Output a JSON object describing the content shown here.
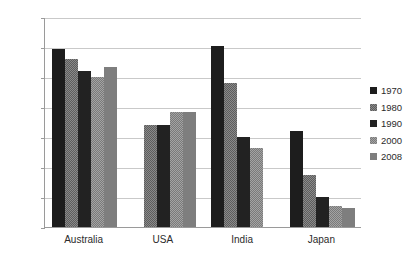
{
  "chart_data": {
    "type": "bar",
    "title": "",
    "subtitle": "",
    "xlabel": "",
    "ylabel": "",
    "categories": [
      "Australia",
      "USA",
      "India",
      "Japan"
    ],
    "ylim": [
      0.0,
      70.0
    ],
    "ytick_labels": [
      "70.0",
      "60.0",
      "50.0",
      "40.0",
      "30.0",
      "20.0",
      "10.0",
      "0.0"
    ],
    "ytick_values": [
      70.0,
      60.0,
      50.0,
      40.0,
      30.0,
      20.0,
      10.0,
      0.0
    ],
    "grid": true,
    "grid_axis": "y",
    "legend_position": "right",
    "series": [
      {
        "name": "1970",
        "color": "#1d1d1d",
        "values": [
          59.5,
          null,
          60.5,
          32.0
        ]
      },
      {
        "name": "1980",
        "color": "#8a8a8a",
        "values": [
          56.0,
          34.0,
          48.0,
          17.5
        ]
      },
      {
        "name": "1990",
        "color": "#222222",
        "values": [
          52.0,
          34.0,
          30.0,
          10.0
        ]
      },
      {
        "name": "2000",
        "color": "#a3a3a3",
        "values": [
          50.0,
          38.5,
          26.5,
          7.0
        ]
      },
      {
        "name": "2008",
        "color": "#7e7e7e",
        "values": [
          53.5,
          38.5,
          null,
          6.5
        ]
      }
    ]
  },
  "legend": {
    "items": [
      {
        "label": "1970"
      },
      {
        "label": "1980"
      },
      {
        "label": "1990"
      },
      {
        "label": "2000"
      },
      {
        "label": "2008"
      }
    ]
  }
}
